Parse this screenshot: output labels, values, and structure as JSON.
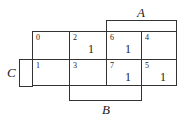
{
  "kmap": {
    "variables": [
      "A",
      "B",
      "C"
    ],
    "labels": {
      "A": "A",
      "B": "B",
      "C": "C"
    },
    "rows": [
      [
        {
          "index": "0",
          "value": ""
        },
        {
          "index": "2",
          "value": "1"
        },
        {
          "index": "6",
          "value": "1"
        },
        {
          "index": "4",
          "value": ""
        }
      ],
      [
        {
          "index": "1",
          "value": ""
        },
        {
          "index": "3",
          "value": ""
        },
        {
          "index": "7",
          "value": "1"
        },
        {
          "index": "5",
          "value": "1"
        }
      ]
    ]
  }
}
